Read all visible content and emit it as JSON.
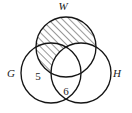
{
  "figure": {
    "type": "venn-diagram",
    "set_count": 3,
    "background_color": "#ffffff",
    "stroke_color": "#151515"
  },
  "sets": [
    {
      "key": "W",
      "label": "W",
      "position": "top",
      "cx": 66,
      "cy": 47,
      "r": 30,
      "label_x": 63,
      "label_y": 10
    },
    {
      "key": "G",
      "label": "G",
      "position": "bottom-left",
      "cx": 51,
      "cy": 73,
      "r": 30,
      "label_x": 11,
      "label_y": 77
    },
    {
      "key": "H",
      "label": "H",
      "position": "bottom-right",
      "cx": 81,
      "cy": 73,
      "r": 30,
      "label_x": 117,
      "label_y": 77
    }
  ],
  "region_labels": [
    {
      "region": "G-only",
      "value": "5",
      "x": 38,
      "y": 80
    },
    {
      "region": "G-intersect-H",
      "value": "6",
      "x": 66,
      "y": 95
    }
  ],
  "shading": {
    "description": "W minus H",
    "pattern": "diagonal-hatch",
    "angle_degrees": 45,
    "line_color": "#1a1a1a",
    "fill_color": "none"
  }
}
